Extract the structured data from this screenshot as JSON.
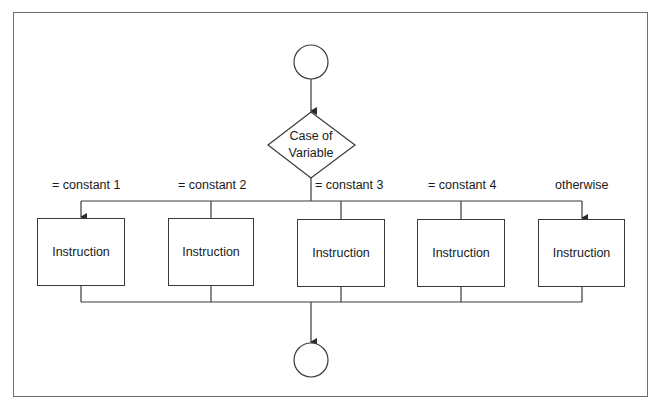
{
  "diagram": {
    "type": "flowchart",
    "title": "",
    "decision": {
      "label_line1": "Case of",
      "label_line2": "Variable"
    },
    "branches": [
      {
        "condition": "= constant 1",
        "box": "Instruction"
      },
      {
        "condition": "= constant 2",
        "box": "Instruction"
      },
      {
        "condition": "= constant 3",
        "box": "Instruction"
      },
      {
        "condition": "= constant 4",
        "box": "Instruction"
      },
      {
        "condition": "otherwise",
        "box": "Instruction"
      }
    ],
    "start_node": "",
    "end_node": ""
  },
  "colors": {
    "stroke": "#3a3a3a",
    "frame": "#6e6e6e",
    "background": "#ffffff"
  }
}
